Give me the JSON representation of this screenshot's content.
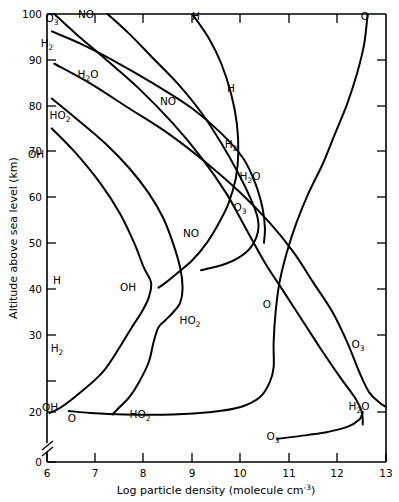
{
  "chart_data": {
    "type": "line",
    "title": "",
    "xlabel": "Log particle density (molecule cm⁻³)",
    "ylabel": "Altitude above sea level (km)",
    "xlim": [
      6,
      13
    ],
    "ylim": [
      0,
      100
    ],
    "grid": false,
    "legend_position": "inline-curve-labels",
    "axis_break_y": true,
    "axis_break_between": [
      0,
      16
    ],
    "xticks": [
      6,
      7,
      8,
      9,
      10,
      11,
      12,
      13
    ],
    "xticklabels": [
      "6",
      "7",
      "8",
      "9",
      "10",
      "11",
      "12",
      "13"
    ],
    "yticks": [
      0,
      20,
      30,
      40,
      50,
      60,
      70,
      80,
      90,
      100
    ],
    "yticklabels": [
      "0",
      "20",
      "30",
      "40",
      "50",
      "60",
      "70",
      "80",
      "90",
      "100"
    ],
    "xlabel_parts": {
      "main": "Log particle density (molecule cm",
      "exponent": "-3",
      "tail": ")"
    },
    "series": [
      {
        "name": "O3-upper",
        "label": "O",
        "label_sub": "3",
        "points": [
          [
            6.15,
            100
          ],
          [
            6.6,
            96
          ],
          [
            7.2,
            91
          ],
          [
            7.9,
            85
          ],
          [
            8.6,
            78
          ],
          [
            9.2,
            71
          ],
          [
            9.7,
            64
          ],
          [
            10.1,
            57
          ],
          [
            10.5,
            50
          ],
          [
            10.9,
            44
          ],
          [
            11.3,
            38
          ],
          [
            11.7,
            32
          ],
          [
            12.05,
            27
          ],
          [
            12.35,
            23
          ],
          [
            12.5,
            20
          ],
          [
            12.52,
            17.5
          ]
        ]
      },
      {
        "name": "O3-lower",
        "label": "O",
        "label_sub": "3",
        "points": [
          [
            12.52,
            20
          ],
          [
            12.45,
            18.5
          ],
          [
            12.2,
            17
          ],
          [
            11.8,
            16
          ],
          [
            11.4,
            15.4
          ],
          [
            11.0,
            14.9
          ],
          [
            10.75,
            14.6
          ]
        ]
      },
      {
        "name": "NO",
        "label": "NO",
        "label_sub": "",
        "points": [
          [
            7.25,
            100
          ],
          [
            7.7,
            96
          ],
          [
            8.2,
            91
          ],
          [
            8.7,
            86
          ],
          [
            9.2,
            80
          ],
          [
            9.6,
            74
          ],
          [
            9.95,
            68
          ],
          [
            10.2,
            63
          ],
          [
            10.35,
            59
          ],
          [
            10.35,
            56
          ],
          [
            10.2,
            53
          ],
          [
            9.95,
            51
          ],
          [
            9.6,
            49.5
          ],
          [
            9.3,
            48.8
          ],
          [
            9.18,
            48.5
          ]
        ]
      },
      {
        "name": "H2-upper",
        "label": "H",
        "label_sub": "2",
        "points": [
          [
            6.1,
            96.5
          ],
          [
            6.7,
            94
          ],
          [
            7.4,
            90.5
          ],
          [
            8.2,
            86
          ],
          [
            9.0,
            81
          ],
          [
            9.6,
            76
          ],
          [
            10.05,
            71
          ],
          [
            10.3,
            66
          ],
          [
            10.45,
            61
          ],
          [
            10.5,
            57
          ],
          [
            10.48,
            54
          ]
        ]
      },
      {
        "name": "H2O",
        "label": "H",
        "label_sub": "2",
        "label_tail": "O",
        "points": [
          [
            6.15,
            90
          ],
          [
            6.9,
            86
          ],
          [
            7.7,
            81
          ],
          [
            8.5,
            76
          ],
          [
            9.3,
            70
          ],
          [
            10.0,
            64
          ],
          [
            10.6,
            58
          ],
          [
            11.1,
            52
          ],
          [
            11.5,
            46
          ],
          [
            11.9,
            40
          ],
          [
            12.2,
            34
          ],
          [
            12.45,
            28
          ],
          [
            12.65,
            24
          ],
          [
            12.85,
            22
          ],
          [
            13.0,
            21
          ]
        ]
      },
      {
        "name": "HO2-upper",
        "label": "HO",
        "label_sub": "2",
        "points": [
          [
            6.1,
            83
          ],
          [
            6.6,
            79
          ],
          [
            7.2,
            74
          ],
          [
            7.7,
            69
          ],
          [
            8.1,
            64
          ],
          [
            8.4,
            59
          ],
          [
            8.6,
            54
          ],
          [
            8.75,
            49
          ],
          [
            8.8,
            45
          ],
          [
            8.75,
            42
          ],
          [
            8.6,
            40
          ],
          [
            8.45,
            38.5
          ],
          [
            8.3,
            37
          ],
          [
            8.2,
            34
          ],
          [
            8.1,
            30
          ],
          [
            7.9,
            26
          ],
          [
            7.7,
            23
          ],
          [
            7.5,
            21
          ],
          [
            7.35,
            19.5
          ]
        ]
      },
      {
        "name": "OH",
        "label": "OH",
        "label_sub": "",
        "points": [
          [
            6.1,
            77
          ],
          [
            6.6,
            72
          ],
          [
            7.1,
            66
          ],
          [
            7.5,
            60
          ],
          [
            7.8,
            54
          ],
          [
            8.0,
            49
          ],
          [
            8.15,
            46
          ],
          [
            8.1,
            43
          ],
          [
            7.95,
            40
          ],
          [
            7.75,
            37
          ],
          [
            7.5,
            33
          ],
          [
            7.15,
            28
          ],
          [
            6.7,
            24
          ],
          [
            6.3,
            21
          ],
          [
            6.05,
            19.8
          ]
        ]
      },
      {
        "name": "H",
        "label": "H",
        "label_sub": "",
        "points": [
          [
            9.0,
            100
          ],
          [
            9.35,
            95
          ],
          [
            9.6,
            90
          ],
          [
            9.8,
            84
          ],
          [
            9.92,
            78
          ],
          [
            9.95,
            72
          ],
          [
            9.9,
            67
          ],
          [
            9.75,
            62
          ],
          [
            9.55,
            58
          ],
          [
            9.3,
            54
          ],
          [
            9.0,
            50.5
          ],
          [
            8.7,
            48
          ],
          [
            8.45,
            46
          ],
          [
            8.3,
            45
          ]
        ]
      },
      {
        "name": "O-right",
        "label": "O",
        "label_sub": "",
        "points": [
          [
            12.62,
            100
          ],
          [
            12.55,
            94
          ],
          [
            12.4,
            88
          ],
          [
            12.2,
            82
          ],
          [
            11.95,
            76
          ],
          [
            11.7,
            70
          ],
          [
            11.4,
            64
          ],
          [
            11.15,
            58
          ],
          [
            10.95,
            52
          ],
          [
            10.8,
            46
          ],
          [
            10.72,
            40
          ],
          [
            10.68,
            34
          ],
          [
            10.68,
            29
          ],
          [
            10.6,
            26
          ],
          [
            10.4,
            23
          ],
          [
            10.0,
            21
          ],
          [
            9.4,
            20
          ],
          [
            8.6,
            19.5
          ],
          [
            7.6,
            19.5
          ],
          [
            6.9,
            19.8
          ],
          [
            6.45,
            20.2
          ]
        ]
      }
    ],
    "curve_labels": [
      {
        "name": "o3-top-label",
        "text": "O",
        "sub": "3",
        "x": 52,
        "y": 22
      },
      {
        "name": "no-top-label",
        "text": "NO",
        "sub": "",
        "x": 86,
        "y": 18
      },
      {
        "name": "h-top-label",
        "text": "H",
        "sub": "",
        "x": 196,
        "y": 20
      },
      {
        "name": "o-top-label",
        "text": "O",
        "sub": "",
        "x": 365,
        "y": 20
      },
      {
        "name": "h2-label",
        "text": "H",
        "sub": "2",
        "x": 47,
        "y": 47
      },
      {
        "name": "h2o-top-label",
        "text": "H",
        "sub": "2",
        "tail": "O",
        "x": 88,
        "y": 78
      },
      {
        "name": "no-mid-label",
        "text": "NO",
        "sub": "",
        "x": 168,
        "y": 105
      },
      {
        "name": "h-mid-label",
        "text": "H",
        "sub": "",
        "x": 231,
        "y": 92
      },
      {
        "name": "ho2-top-label",
        "text": "HO",
        "sub": "2",
        "x": 60,
        "y": 119
      },
      {
        "name": "h2-mid-label",
        "text": "H",
        "sub": "2",
        "x": 231,
        "y": 148
      },
      {
        "name": "oh-top-label",
        "text": "OH",
        "sub": "",
        "x": 36,
        "y": 158
      },
      {
        "name": "h2o-mid-label",
        "text": "H",
        "sub": "2",
        "tail": "O",
        "x": 250,
        "y": 180
      },
      {
        "name": "o3-mid-label",
        "text": "O",
        "sub": "3",
        "x": 240,
        "y": 211
      },
      {
        "name": "no-low-label",
        "text": "NO",
        "sub": "",
        "x": 191,
        "y": 237
      },
      {
        "name": "h-low-label",
        "text": "H",
        "sub": "",
        "x": 57,
        "y": 284
      },
      {
        "name": "oh-mid-label",
        "text": "OH",
        "sub": "",
        "x": 128,
        "y": 291
      },
      {
        "name": "o-mid-label",
        "text": "O",
        "sub": "",
        "x": 267,
        "y": 308
      },
      {
        "name": "ho2-mid-label",
        "text": "HO",
        "sub": "2",
        "x": 190,
        "y": 324
      },
      {
        "name": "h2-low-label",
        "text": "H",
        "sub": "2",
        "x": 57,
        "y": 352
      },
      {
        "name": "o3-right-label",
        "text": "O",
        "sub": "3",
        "x": 358,
        "y": 348
      },
      {
        "name": "oh-low-label",
        "text": "OH",
        "sub": "",
        "x": 50,
        "y": 411
      },
      {
        "name": "o-low-label",
        "text": "O",
        "sub": "",
        "x": 72,
        "y": 422
      },
      {
        "name": "ho2-low-label",
        "text": "HO",
        "sub": "2",
        "x": 140,
        "y": 418
      },
      {
        "name": "h2o-right-label",
        "text": "H",
        "sub": "2",
        "tail": "O",
        "x": 359,
        "y": 410
      },
      {
        "name": "o3-bottom-label",
        "text": "O",
        "sub": "3",
        "x": 273,
        "y": 440
      }
    ]
  }
}
